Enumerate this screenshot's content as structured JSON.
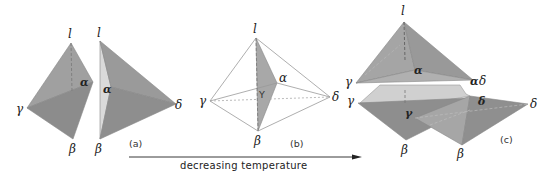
{
  "figure": {
    "panels": [
      {
        "id": "a",
        "caption": "(a)"
      },
      {
        "id": "b",
        "caption": "(b)"
      },
      {
        "id": "c",
        "caption": "(c)"
      }
    ],
    "vertex_labels": {
      "liquid": "l",
      "alpha": "α",
      "beta": "β",
      "gamma": "γ",
      "delta": "δ",
      "center": "Y"
    },
    "arrow_label": "decreasing temperature"
  },
  "colors": {
    "face_dark": "#8c8c8c",
    "face_mid": "#9d9d9d",
    "face_light": "#d9d9d9",
    "face_pale": "#c8c8c8",
    "edge": "#777777",
    "thin_edge": "#8a8a8a"
  }
}
